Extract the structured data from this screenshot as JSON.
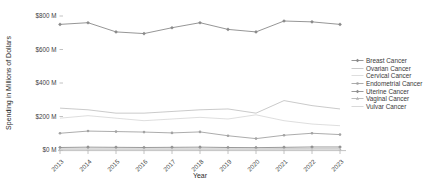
{
  "chart_data": {
    "type": "line",
    "title": "",
    "xlabel": "Year",
    "ylabel": "Spending in Millions of Dollars",
    "x": [
      2013,
      2014,
      2015,
      2016,
      2017,
      2018,
      2019,
      2020,
      2021,
      2022,
      2023
    ],
    "ylim": [
      0,
      800
    ],
    "ytick_values": [
      0,
      200,
      400,
      600,
      800
    ],
    "ytick_labels": [
      "$0 M",
      "$200 M",
      "$400 M",
      "$600 M",
      "$800 M"
    ],
    "grid": false,
    "legend_position": "right",
    "background": "#ffffff",
    "axis_color": "#b3b3b3",
    "text_color": "#404040",
    "series": [
      {
        "name": "Breast Cancer",
        "color": "#8a8a8a",
        "marker": "diamond",
        "values": [
          750,
          760,
          705,
          695,
          730,
          760,
          720,
          705,
          770,
          765,
          750
        ]
      },
      {
        "name": "Ovarian Cancer",
        "color": "#c4c4c4",
        "marker": "none",
        "values": [
          250,
          240,
          220,
          220,
          230,
          240,
          245,
          220,
          295,
          265,
          245
        ]
      },
      {
        "name": "Cervical Cancer",
        "color": "#dadada",
        "marker": "none",
        "values": [
          190,
          205,
          190,
          175,
          185,
          195,
          185,
          210,
          175,
          155,
          145
        ]
      },
      {
        "name": "Endometrial Cancer",
        "color": "#a3a3a3",
        "marker": "circle",
        "values": [
          100,
          113,
          110,
          107,
          102,
          108,
          85,
          68,
          88,
          100,
          92
        ]
      },
      {
        "name": "Uterine Cancer",
        "color": "#8f8f8f",
        "marker": "diamond",
        "values": [
          15,
          17,
          16,
          15,
          16,
          17,
          15,
          14,
          16,
          18,
          18
        ]
      },
      {
        "name": "Vaginal Cancer",
        "color": "#b5b5b5",
        "marker": "triangle",
        "values": [
          6,
          6,
          6,
          6,
          6,
          6,
          6,
          6,
          7,
          7,
          7
        ]
      },
      {
        "name": "Vulvar Cancer",
        "color": "#d5d5d5",
        "marker": "none",
        "values": [
          3,
          3,
          3,
          3,
          3,
          3,
          3,
          3,
          3,
          4,
          4
        ]
      }
    ]
  }
}
